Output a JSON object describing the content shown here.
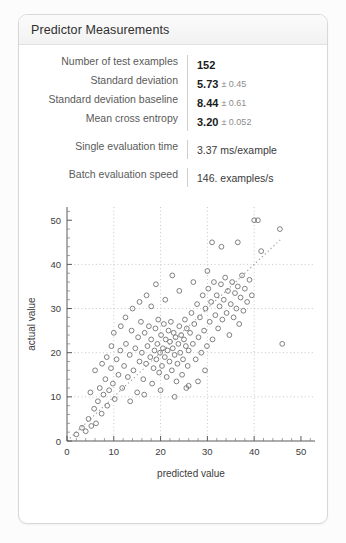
{
  "card": {
    "title": "Predictor Measurements"
  },
  "stats": [
    {
      "label": "Number of test examples",
      "value": "152",
      "error": "",
      "style": "bold",
      "spaced": false
    },
    {
      "label": "Standard deviation",
      "value": "5.73",
      "error": "± 0.45",
      "style": "bold",
      "spaced": false
    },
    {
      "label": "Standard deviation baseline",
      "value": "8.44",
      "error": "± 0.61",
      "style": "bold",
      "spaced": false
    },
    {
      "label": "Mean cross entropy",
      "value": "3.20",
      "error": "± 0.052",
      "style": "bold",
      "spaced": false
    },
    {
      "label": "Single evaluation time",
      "value": "3.37 ms/example",
      "error": "",
      "style": "plain",
      "spaced": true
    },
    {
      "label": "Batch evaluation speed",
      "value": "146. examples/s",
      "error": "",
      "style": "plain",
      "spaced": true
    }
  ],
  "chart_data": {
    "type": "scatter",
    "title": "",
    "xlabel": "predicted value",
    "ylabel": "actual value",
    "xlim": [
      0,
      53
    ],
    "ylim": [
      0,
      53
    ],
    "xticks": [
      0,
      10,
      20,
      30,
      40,
      50
    ],
    "yticks": [
      0,
      10,
      20,
      30,
      40,
      50
    ],
    "minor_tick_step": 2,
    "grid": true,
    "grid_at": [
      10,
      20,
      30,
      40
    ],
    "reference_line": {
      "type": "identity",
      "from": [
        0,
        0
      ],
      "to": [
        46,
        46
      ],
      "style": "dotted"
    },
    "marker": {
      "shape": "open-circle",
      "radius": 2.4,
      "color": "#737373"
    },
    "n_points": 152,
    "points": [
      [
        2.0,
        1.5
      ],
      [
        3.2,
        3.0
      ],
      [
        4.0,
        2.2
      ],
      [
        4.6,
        5.0
      ],
      [
        5.2,
        3.4
      ],
      [
        5.8,
        7.3
      ],
      [
        6.2,
        4.0
      ],
      [
        6.6,
        9.0
      ],
      [
        7.0,
        12.0
      ],
      [
        7.4,
        6.2
      ],
      [
        7.8,
        10.5
      ],
      [
        8.2,
        14.0
      ],
      [
        8.6,
        8.0
      ],
      [
        9.0,
        11.5
      ],
      [
        9.4,
        16.5
      ],
      [
        9.8,
        13.0
      ],
      [
        10.2,
        9.5
      ],
      [
        10.6,
        18.5
      ],
      [
        11.0,
        15.0
      ],
      [
        11.4,
        20.5
      ],
      [
        11.8,
        12.0
      ],
      [
        12.2,
        17.0
      ],
      [
        12.6,
        22.0
      ],
      [
        13.0,
        14.5
      ],
      [
        13.4,
        19.5
      ],
      [
        13.8,
        25.0
      ],
      [
        14.2,
        16.0
      ],
      [
        14.6,
        21.0
      ],
      [
        15.0,
        11.0
      ],
      [
        15.2,
        23.5
      ],
      [
        15.5,
        18.0
      ],
      [
        15.8,
        27.0
      ],
      [
        16.0,
        20.0
      ],
      [
        16.3,
        14.0
      ],
      [
        16.6,
        24.5
      ],
      [
        16.9,
        17.5
      ],
      [
        17.2,
        21.5
      ],
      [
        17.5,
        26.0
      ],
      [
        17.8,
        19.0
      ],
      [
        18.0,
        23.0
      ],
      [
        18.2,
        13.0
      ],
      [
        18.5,
        16.5
      ],
      [
        18.7,
        20.5
      ],
      [
        18.9,
        25.5
      ],
      [
        19.1,
        18.5
      ],
      [
        19.3,
        22.0
      ],
      [
        19.5,
        27.5
      ],
      [
        19.7,
        15.5
      ],
      [
        19.9,
        20.0
      ],
      [
        20.1,
        24.0
      ],
      [
        20.3,
        17.0
      ],
      [
        20.5,
        21.0
      ],
      [
        20.7,
        26.5
      ],
      [
        20.9,
        19.0
      ],
      [
        21.1,
        23.0
      ],
      [
        21.3,
        14.5
      ],
      [
        21.5,
        20.5
      ],
      [
        21.7,
        25.0
      ],
      [
        21.9,
        18.0
      ],
      [
        22.0,
        22.5
      ],
      [
        22.2,
        27.0
      ],
      [
        22.4,
        16.0
      ],
      [
        22.6,
        21.0
      ],
      [
        22.8,
        24.5
      ],
      [
        23.0,
        19.5
      ],
      [
        23.2,
        23.5
      ],
      [
        23.4,
        13.5
      ],
      [
        23.6,
        17.5
      ],
      [
        23.8,
        22.0
      ],
      [
        24.0,
        26.0
      ],
      [
        24.2,
        20.0
      ],
      [
        24.4,
        24.0
      ],
      [
        24.6,
        15.0
      ],
      [
        24.8,
        18.5
      ],
      [
        25.0,
        23.0
      ],
      [
        25.2,
        27.5
      ],
      [
        25.4,
        21.5
      ],
      [
        25.6,
        25.5
      ],
      [
        25.8,
        17.0
      ],
      [
        26.0,
        20.5
      ],
      [
        26.3,
        24.5
      ],
      [
        26.6,
        29.0
      ],
      [
        26.9,
        22.0
      ],
      [
        27.2,
        26.5
      ],
      [
        27.5,
        18.5
      ],
      [
        27.8,
        31.0
      ],
      [
        28.1,
        23.5
      ],
      [
        28.4,
        28.0
      ],
      [
        28.7,
        20.0
      ],
      [
        29.0,
        33.0
      ],
      [
        29.3,
        25.0
      ],
      [
        29.6,
        30.0
      ],
      [
        29.9,
        21.5
      ],
      [
        30.2,
        34.5
      ],
      [
        30.5,
        27.0
      ],
      [
        30.8,
        31.5
      ],
      [
        31.1,
        23.0
      ],
      [
        31.4,
        36.0
      ],
      [
        31.7,
        28.5
      ],
      [
        32.0,
        33.0
      ],
      [
        32.3,
        25.5
      ],
      [
        32.6,
        30.5
      ],
      [
        32.9,
        35.5
      ],
      [
        33.2,
        27.5
      ],
      [
        33.5,
        32.0
      ],
      [
        33.8,
        37.0
      ],
      [
        34.1,
        29.0
      ],
      [
        34.4,
        34.0
      ],
      [
        34.7,
        24.0
      ],
      [
        35.0,
        31.0
      ],
      [
        35.3,
        36.0
      ],
      [
        35.6,
        28.0
      ],
      [
        35.9,
        33.5
      ],
      [
        36.2,
        30.0
      ],
      [
        36.5,
        35.0
      ],
      [
        36.8,
        26.5
      ],
      [
        37.1,
        32.5
      ],
      [
        37.4,
        37.5
      ],
      [
        37.7,
        29.5
      ],
      [
        38.0,
        34.5
      ],
      [
        38.5,
        31.5
      ],
      [
        39.0,
        36.5
      ],
      [
        39.5,
        33.0
      ],
      [
        40.0,
        50.0
      ],
      [
        40.8,
        50.0
      ],
      [
        41.5,
        43.0
      ],
      [
        45.5,
        48.0
      ],
      [
        46.0,
        22.0
      ],
      [
        33.0,
        44.0
      ],
      [
        36.5,
        45.0
      ],
      [
        31.0,
        45.0
      ],
      [
        28.0,
        13.5
      ],
      [
        29.5,
        16.0
      ],
      [
        26.0,
        12.5
      ],
      [
        12.5,
        28.0
      ],
      [
        14.0,
        30.0
      ],
      [
        8.5,
        19.0
      ],
      [
        6.0,
        16.0
      ],
      [
        10.0,
        24.5
      ],
      [
        13.5,
        9.0
      ],
      [
        16.5,
        10.5
      ],
      [
        20.0,
        11.5
      ],
      [
        23.0,
        10.0
      ],
      [
        25.5,
        12.0
      ],
      [
        18.0,
        30.5
      ],
      [
        21.0,
        32.0
      ],
      [
        24.0,
        34.0
      ],
      [
        27.0,
        36.0
      ],
      [
        30.0,
        38.5
      ],
      [
        19.0,
        35.5
      ],
      [
        22.5,
        37.5
      ],
      [
        17.0,
        33.0
      ],
      [
        15.5,
        31.5
      ],
      [
        11.5,
        26.0
      ],
      [
        9.5,
        21.5
      ],
      [
        7.5,
        17.5
      ],
      [
        5.0,
        11.0
      ]
    ]
  }
}
